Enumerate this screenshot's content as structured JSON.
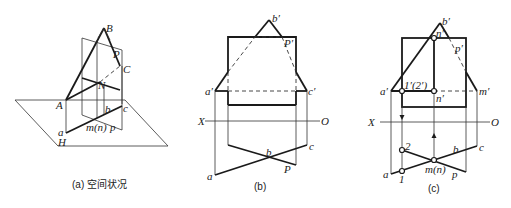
{
  "panels": {
    "a": {
      "caption": "(a) 空间状况",
      "labels": {
        "B": "B",
        "P": "P",
        "C": "C",
        "N": "N",
        "A": "A",
        "b": "b",
        "c": "c",
        "a": "a",
        "mn": "m(n)",
        "p": "p",
        "H": "H"
      }
    },
    "b": {
      "caption": "(b)",
      "labels": {
        "b_prime": "b′",
        "P_prime": "P′",
        "a_prime": "a′",
        "c_prime": "c′",
        "X": "X",
        "O": "O",
        "b": "b",
        "c": "c",
        "a": "a",
        "P": "P"
      }
    },
    "c": {
      "caption": "(c)",
      "labels": {
        "b_prime": "b′",
        "n_prime_top": "n′",
        "p_prime": "p′",
        "a_prime": "a′",
        "one_two_prime": "1′(2′)",
        "n_prime": "n′",
        "m_prime": "m′",
        "X": "X",
        "O": "O",
        "two": "2",
        "b": "b",
        "c": "c",
        "a": "a",
        "mn": "m(n)",
        "p": "p",
        "one": "1"
      }
    }
  }
}
